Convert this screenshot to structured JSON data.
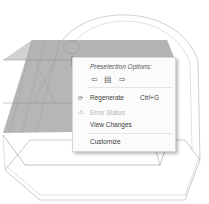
{
  "context_menu": {
    "title": "Preselection Options:",
    "arrows": [
      {
        "icon": "arrow-left-icon",
        "glyph": "⇦"
      },
      {
        "icon": "select-filter-icon",
        "glyph": "▤"
      },
      {
        "icon": "arrow-right-icon",
        "glyph": "⇨"
      }
    ],
    "items": [
      {
        "label": "Regenerate",
        "shortcut": "Ctrl+G",
        "icon": "regenerate-icon",
        "enabled": true
      },
      {
        "label": "Error Status",
        "shortcut": "",
        "icon": "error-status-icon",
        "enabled": false
      },
      {
        "label": "View Changes",
        "shortcut": "",
        "icon": "",
        "enabled": true
      },
      {
        "label": "Customize",
        "shortcut": "",
        "icon": "",
        "enabled": true
      }
    ]
  },
  "colors": {
    "selected_face": "#a9a9a9",
    "edge": "#8a8a8a"
  }
}
